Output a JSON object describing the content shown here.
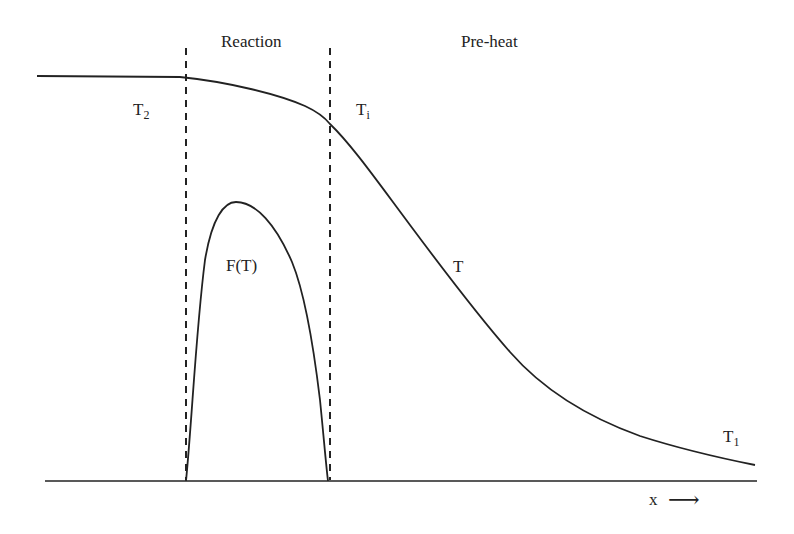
{
  "diagram": {
    "type": "flame-structure",
    "regions": {
      "reaction": "Reaction",
      "preheat": "Pre-heat"
    },
    "labels": {
      "t2_main": "T",
      "t2_sub": "2",
      "ti_main": "T",
      "ti_sub": "i",
      "t_curve": "T",
      "t1_main": "T",
      "t1_sub": "1",
      "ft": "F(T)",
      "x_axis": "x",
      "x_arrow": "⟶"
    },
    "colors": {
      "stroke": "#222222",
      "background": "#ffffff"
    }
  }
}
